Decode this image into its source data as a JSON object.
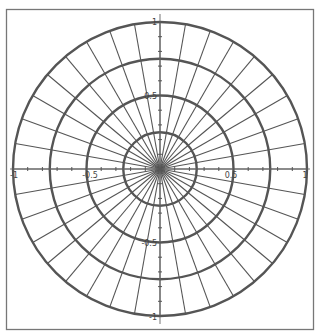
{
  "chart_data": {
    "type": "polar-grid",
    "title": "",
    "xlabel": "",
    "ylabel": "",
    "xlim": [
      -1,
      1
    ],
    "ylim": [
      -1,
      1
    ],
    "rings": [
      0.25,
      0.5,
      0.75,
      1.0
    ],
    "radial_line_step_deg": 10,
    "radial_line_count": 36,
    "x_tick_labels": [
      {
        "value": -1,
        "label": "-1"
      },
      {
        "value": -0.5,
        "label": "-0.5"
      },
      {
        "value": 0.5,
        "label": "0.5"
      },
      {
        "value": 1,
        "label": "1"
      }
    ],
    "y_tick_labels": [
      {
        "value": 1,
        "label": "1"
      },
      {
        "value": 0.5,
        "label": "0.5"
      },
      {
        "value": -0.5,
        "label": "-0.5"
      },
      {
        "value": -1,
        "label": "-1"
      }
    ],
    "grid": true,
    "legend": null,
    "colors": {
      "grid": "#555555",
      "frame": "#777777",
      "background": "#ffffff"
    }
  },
  "labels": {
    "x_neg1": "-1",
    "x_neg05": "-0.5",
    "x_pos05": "0.5",
    "x_pos1": "1",
    "y_pos1": "1",
    "y_pos05": "0.5",
    "y_neg05": "-0.5",
    "y_neg1": "-1"
  }
}
